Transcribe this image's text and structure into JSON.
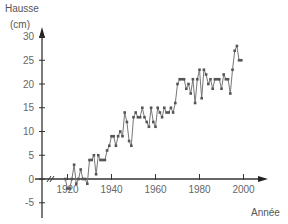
{
  "chart_data": {
    "type": "line",
    "title": "",
    "ylabel": "Hausse",
    "yunit": "(cm)",
    "xlabel": "Année",
    "xlim": [
      1910,
      2010
    ],
    "ylim": [
      -7,
      33
    ],
    "x_ticks": [
      1920,
      1940,
      1960,
      1980,
      2000
    ],
    "y_ticks": [
      -5,
      0,
      5,
      10,
      15,
      20,
      25,
      30
    ],
    "grid": false,
    "legend": null,
    "axis_break_on_x": true,
    "series": [
      {
        "name": "Hausse du niveau",
        "color": "#555555",
        "x": [
          1919,
          1920,
          1921,
          1922,
          1923,
          1924,
          1925,
          1926,
          1927,
          1928,
          1929,
          1930,
          1931,
          1932,
          1933,
          1934,
          1935,
          1936,
          1937,
          1938,
          1939,
          1940,
          1941,
          1942,
          1943,
          1944,
          1945,
          1946,
          1947,
          1948,
          1949,
          1950,
          1951,
          1952,
          1953,
          1954,
          1955,
          1956,
          1957,
          1958,
          1959,
          1960,
          1961,
          1962,
          1963,
          1964,
          1965,
          1966,
          1967,
          1968,
          1969,
          1970,
          1971,
          1972,
          1973,
          1974,
          1975,
          1976,
          1977,
          1978,
          1979,
          1980,
          1981,
          1982,
          1983,
          1984,
          1985,
          1986,
          1987,
          1988,
          1989,
          1990,
          1991,
          1992,
          1993,
          1994,
          1995,
          1996,
          1997,
          1998,
          1999
        ],
        "values": [
          0,
          -2,
          -2,
          0,
          3,
          -1,
          0,
          2,
          0,
          0,
          -1,
          4,
          4,
          5,
          1,
          5,
          4,
          4,
          4,
          6,
          7,
          9,
          9,
          7,
          9,
          10,
          9,
          14,
          12,
          8,
          7,
          13,
          14,
          13,
          13,
          15,
          13,
          12,
          11,
          15,
          12,
          11,
          15,
          14,
          13,
          15,
          14,
          14,
          15,
          14,
          16,
          20,
          21,
          21,
          21,
          19,
          20,
          18,
          21,
          16,
          21,
          23,
          17,
          23,
          22,
          20,
          21,
          19,
          21,
          21,
          21,
          19,
          22,
          21,
          21,
          18,
          23,
          27,
          28,
          25,
          25
        ]
      }
    ]
  },
  "axes": {
    "y_title": "Hausse",
    "y_unit": "(cm)",
    "x_title": "Année"
  }
}
